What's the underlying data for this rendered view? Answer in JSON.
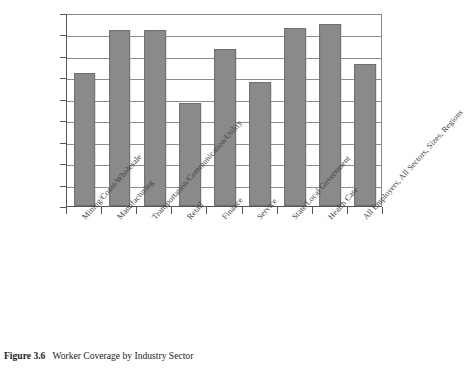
{
  "caption": {
    "number": "Figure 3.6",
    "text": "Worker Coverage by Industry Sector"
  },
  "chart_data": {
    "type": "bar",
    "title": "Worker Coverage by Industry Sector",
    "xlabel": "",
    "ylabel": "",
    "ylim": [
      0,
      0.9
    ],
    "ytick_labels": [
      "0",
      "0.1",
      "0.2",
      "0.3",
      "0.4",
      "0.5",
      "0.6",
      "0.7",
      "0.8",
      "0.9"
    ],
    "ytick_values": [
      0,
      0.1,
      0.2,
      0.3,
      0.4,
      0.5,
      0.6,
      0.7,
      0.8,
      0.9
    ],
    "grid": true,
    "legend": null,
    "bar_color": "#8a8a8a",
    "bar_edge_color": "#6f6f6f",
    "categories": [
      "Mining/Const/Wholesale",
      "Manufacturing",
      "Transportation/Communication/Utility",
      "Retail",
      "Finance",
      "Service",
      "State/Local Government",
      "Health Care",
      "All Employers, All Sectors, Sizes, Regions"
    ],
    "values": [
      0.62,
      0.82,
      0.82,
      0.48,
      0.73,
      0.58,
      0.83,
      0.85,
      0.66
    ]
  }
}
